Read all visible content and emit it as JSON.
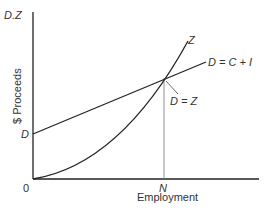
{
  "diagram": {
    "y_axis_top_label": "D.Z",
    "y_axis_title": "$ Proceeds",
    "x_axis_title": "Employment",
    "origin_label": "0",
    "d_intercept_label": "D",
    "n_label": "N",
    "z_curve_label": "Z",
    "d_line_label": "D = C + I",
    "intersection_label": "D = Z",
    "colors": {
      "axis": "#222222",
      "curve": "#222222",
      "guide": "#777777",
      "text": "#333333"
    }
  }
}
